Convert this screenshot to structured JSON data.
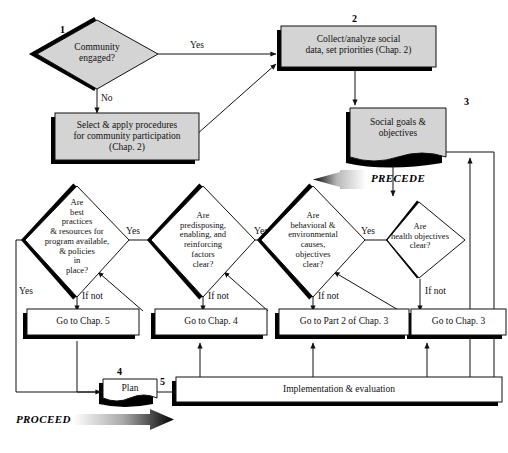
{
  "figure": {
    "type": "flowchart",
    "phases": [
      {
        "name": "PRECEDE",
        "direction": "left"
      },
      {
        "name": "PROCEED",
        "direction": "right"
      }
    ]
  },
  "nodes": {
    "d1": {
      "number": "1",
      "text": "Community\nengaged?",
      "shape": "diamond",
      "fill": "gray"
    },
    "b_select": {
      "text": "Select & apply procedures\nfor community participation\n(Chap. 2)",
      "shape": "box",
      "fill": "gray"
    },
    "b2": {
      "number": "2",
      "text": "Collect/analyze social\ndata, set priorities (Chap. 2)",
      "shape": "box",
      "fill": "gray"
    },
    "b3": {
      "number": "3",
      "text": "Social goals &\nobjectives",
      "shape": "document",
      "fill": "gray"
    },
    "d_health": {
      "text": "Are\nhealth objectives\nclear?",
      "shape": "diamond",
      "fill": "white"
    },
    "d_behav": {
      "text": "Are\nbehavioral &\nenvironmental\ncauses,\nobjectives\nclear?",
      "shape": "diamond",
      "fill": "white"
    },
    "d_predis": {
      "text": "Are\npredisposing,\nenabling, and\nreinforcing\nfactors\nclear?",
      "shape": "diamond",
      "fill": "white"
    },
    "d_best": {
      "text": "Are\nbest\npractices\n& resources for\nprogram available,\n& policies\nin\nplace?",
      "shape": "diamond",
      "fill": "white"
    },
    "g_ch3": {
      "text": "Go to Chap. 3",
      "shape": "box",
      "fill": "white"
    },
    "g_part2ch3": {
      "text": "Go to Part 2 of Chap. 3",
      "shape": "box",
      "fill": "white"
    },
    "g_ch4": {
      "text": "Go to Chap. 4",
      "shape": "box",
      "fill": "white"
    },
    "g_ch5": {
      "text": "Go to Chap. 5",
      "shape": "box",
      "fill": "white"
    },
    "b_plan": {
      "number": "4",
      "text": "Plan",
      "shape": "document",
      "fill": "white"
    },
    "b_impl": {
      "number": "5",
      "text": "Implementation & evaluation",
      "shape": "box",
      "fill": "white"
    }
  },
  "edge_labels": {
    "yes_community": "Yes",
    "no_community": "No",
    "yes_health": "Yes",
    "yes_behav": "Yes",
    "yes_predis": "Yes",
    "yes_best": "Yes",
    "ifnot_health": "If not",
    "ifnot_behav": "If not",
    "ifnot_predis": "If not",
    "ifnot_best": "If not"
  },
  "colors": {
    "fill_gray": "#d4d4d4",
    "stroke": "#111111",
    "shadow": "#000000",
    "background": "#ffffff"
  }
}
